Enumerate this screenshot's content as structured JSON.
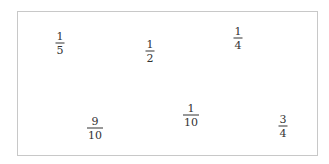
{
  "canvas": {
    "border_color": "#c8c8c8",
    "text_color": "#333333"
  },
  "fractions": [
    {
      "numerator": "1",
      "denominator": "5",
      "x": 60,
      "y": 43
    },
    {
      "numerator": "1",
      "denominator": "2",
      "x": 150,
      "y": 51
    },
    {
      "numerator": "1",
      "denominator": "4",
      "x": 238,
      "y": 38
    },
    {
      "numerator": "9",
      "denominator": "10",
      "x": 95,
      "y": 128
    },
    {
      "numerator": "1",
      "denominator": "10",
      "x": 191,
      "y": 115
    },
    {
      "numerator": "3",
      "denominator": "4",
      "x": 283,
      "y": 126
    }
  ]
}
